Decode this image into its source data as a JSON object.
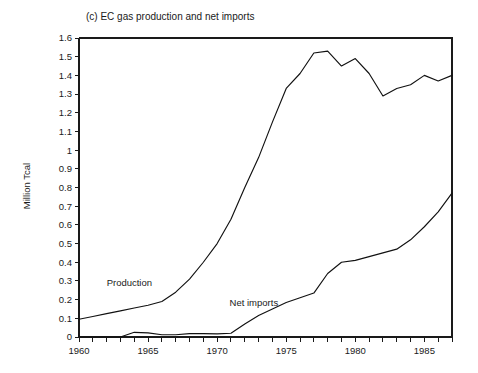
{
  "figure": {
    "label": "(c)",
    "title": "(c)  EC gas production and net imports",
    "background": "#ffffff",
    "line_color": "#111111"
  },
  "chart_data": {
    "type": "line",
    "title": "(c)  EC gas production and net imports",
    "xlabel": "",
    "ylabel": "Million Tcal",
    "xlim": [
      1960,
      1987
    ],
    "ylim": [
      0,
      1.6
    ],
    "grid": false,
    "legend_position": "inline-annotations",
    "y_ticks": [
      0,
      0.1,
      0.2,
      0.3,
      0.4,
      0.5,
      0.6,
      0.7,
      0.8,
      0.9,
      1,
      1.1,
      1.2,
      1.3,
      1.4,
      1.5,
      1.6
    ],
    "y_tick_labels": [
      "0",
      "0.1",
      "0.2",
      "0.3",
      "0.4",
      "0.5",
      "0.6",
      "0.7",
      "0.8",
      "0.9",
      "1",
      "1.1",
      "1.2",
      "1.3",
      "1.4",
      "1.5",
      "1.6"
    ],
    "x_ticks": [
      1960,
      1961,
      1962,
      1963,
      1964,
      1965,
      1966,
      1967,
      1968,
      1969,
      1970,
      1971,
      1972,
      1973,
      1974,
      1975,
      1976,
      1977,
      1978,
      1979,
      1980,
      1981,
      1982,
      1983,
      1984,
      1985,
      1986,
      1987
    ],
    "x_tick_labels": [
      "1960",
      "",
      "",
      "",
      "",
      "1965",
      "",
      "",
      "",
      "",
      "1970",
      "",
      "",
      "",
      "",
      "1975",
      "",
      "",
      "",
      "",
      "1980",
      "",
      "",
      "",
      "",
      "1985",
      "",
      ""
    ],
    "x": [
      1960,
      1961,
      1962,
      1963,
      1964,
      1965,
      1966,
      1967,
      1968,
      1969,
      1970,
      1971,
      1972,
      1973,
      1974,
      1975,
      1976,
      1977,
      1978,
      1979,
      1980,
      1981,
      1982,
      1983,
      1984,
      1985,
      1986,
      1987
    ],
    "series": [
      {
        "name": "Production",
        "label": "Production",
        "label_x": 1962.0,
        "label_y": 0.275,
        "values": [
          0.095,
          0.11,
          0.125,
          0.14,
          0.155,
          0.17,
          0.19,
          0.24,
          0.31,
          0.4,
          0.5,
          0.63,
          0.8,
          0.96,
          1.15,
          1.33,
          1.41,
          1.52,
          1.53,
          1.45,
          1.49,
          1.41,
          1.29,
          1.33,
          1.35,
          1.4,
          1.37,
          1.4
        ]
      },
      {
        "name": "Net imports",
        "label": "Net imports",
        "label_x": 1970.9,
        "label_y": 0.165,
        "values": [
          0.0,
          0.0,
          0.0,
          0.0,
          0.025,
          0.022,
          0.012,
          0.012,
          0.018,
          0.018,
          0.017,
          0.02,
          0.07,
          0.115,
          0.15,
          0.185,
          0.21,
          0.235,
          0.34,
          0.4,
          0.41,
          0.43,
          0.45,
          0.47,
          0.52,
          0.59,
          0.67,
          0.77
        ]
      }
    ]
  }
}
